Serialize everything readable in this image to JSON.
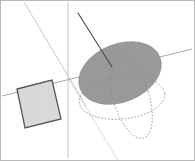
{
  "viewport": {
    "width": 195,
    "height": 161,
    "background_color": "#ffffff",
    "border_color": "#b8b8b8",
    "border_width": 1,
    "title": "3D Geometry Viewport"
  },
  "colors": {
    "sphere_fill": "#999999",
    "sphere_stroke": "#8d8d8d",
    "plane_fill": "#d9d9d9",
    "plane_stroke": "#555555",
    "axis_light": "#c9c9c9",
    "axis_mid": "#9a9a9a",
    "dashed_stroke": "#8a8a8a",
    "normal_line": "#4a4a4a",
    "frame": "#b8b8b8"
  },
  "objects": {
    "sphere": {
      "name": "shaded-sphere-disc",
      "label": "Sphere",
      "center_x": 120,
      "center_y": 73,
      "radius_x": 43,
      "radius_y": 29,
      "rotation_deg": -22,
      "fill": "#999999",
      "opacity": 0.95
    },
    "equator_ellipse": {
      "name": "equator-great-circle",
      "label": "Equator great circle",
      "center_x": 122,
      "center_y": 98,
      "radius_x": 43,
      "radius_y": 21,
      "rotation_deg": -6,
      "dash": "1.6 1.7"
    },
    "meridian_ellipse": {
      "name": "meridian-great-circle",
      "label": "Meridian great circle",
      "center_x": 131,
      "center_y": 97,
      "radius_x": 18,
      "radius_y": 43,
      "rotation_deg": -17,
      "dash": "1.6 1.7"
    },
    "plane": {
      "name": "tilted-square-plane",
      "label": "Tangent plane",
      "points": "17,89 52,80 61,119 25,128",
      "fill": "#d9d9d9",
      "stroke": "#555555",
      "stroke_width": 1.3
    },
    "normal_line": {
      "name": "normal-radius-line",
      "label": "Normal / radius",
      "x1": 78,
      "y1": 13,
      "x2": 112,
      "y2": 67,
      "stroke": "#4a4a4a",
      "stroke_width": 1.1
    }
  },
  "axes": [
    {
      "name": "axis-vertical",
      "label": "Vertical axis",
      "x1": 68,
      "y1": 2,
      "x2": 68,
      "y2": 158,
      "stroke": "#c4c4c4",
      "stroke_width": 1.0,
      "dash": "none"
    },
    {
      "name": "axis-diagonal-depth",
      "label": "Depth axis",
      "x1": 24,
      "y1": 2,
      "x2": 86,
      "y2": 106,
      "stroke": "#c8c8c8",
      "stroke_width": 1.0,
      "dash": "none"
    },
    {
      "name": "axis-horizontal-perspective",
      "label": "Horizontal axis",
      "x1": 2,
      "y1": 96,
      "x2": 192,
      "y2": 49,
      "stroke": "#a8a8a8",
      "stroke_width": 1.0,
      "dash": "none"
    },
    {
      "name": "axis-diagonal-foreground",
      "label": "Foreground axis",
      "x1": 68,
      "y1": 78,
      "x2": 118,
      "y2": 160,
      "stroke": "#dcdcdc",
      "stroke_width": 1.0,
      "dash": "none"
    }
  ],
  "hatch": {
    "name": "plane-hatch-pattern",
    "spacing": 1.5,
    "stroke": "#c6c6c6",
    "stroke_width": 0.45
  }
}
